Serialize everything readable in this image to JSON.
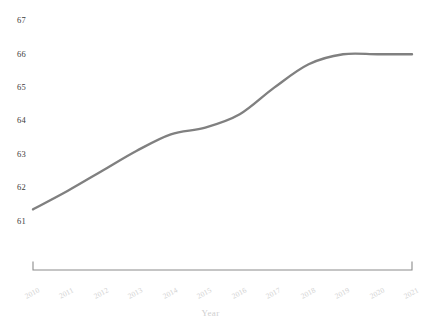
{
  "chart_data": {
    "type": "line",
    "title": "",
    "xlabel": "Year",
    "ylabel": "",
    "grid": false,
    "legend": "none",
    "line_color": "#808080",
    "ytick_color": "#3b3b3b",
    "xtick_color": "#d2d2d2",
    "axis_color": "#8c8c8c",
    "xlim": [
      2010,
      2021
    ],
    "ylim": [
      61,
      67
    ],
    "x": [
      2010,
      2011,
      2012,
      2013,
      2014,
      2015,
      2016,
      2017,
      2018,
      2019,
      2020,
      2021
    ],
    "categories": [
      "2010",
      "2011",
      "2012",
      "2013",
      "2014",
      "2015",
      "2016",
      "2017",
      "2018",
      "2019",
      "2020",
      "2021"
    ],
    "values": [
      61.35,
      61.9,
      62.5,
      63.1,
      63.6,
      63.8,
      64.2,
      65.0,
      65.7,
      66.0,
      66.0,
      66.0
    ],
    "series": [
      {
        "name": "value",
        "values": [
          61.35,
          61.9,
          62.5,
          63.1,
          63.6,
          63.8,
          64.2,
          65.0,
          65.7,
          66.0,
          66.0,
          66.0
        ]
      }
    ],
    "yticks": [
      61,
      62,
      63,
      64,
      65,
      66,
      67
    ],
    "ytick_labels": [
      "61",
      "62",
      "63",
      "64",
      "65",
      "66",
      "67"
    ],
    "xticks": [
      2010,
      2011,
      2012,
      2013,
      2014,
      2015,
      2016,
      2017,
      2018,
      2019,
      2020,
      2021
    ],
    "xtick_labels": [
      "2010",
      "2011",
      "2012",
      "2013",
      "2014",
      "2015",
      "2016",
      "2017",
      "2018",
      "2019",
      "2020",
      "2021"
    ]
  }
}
